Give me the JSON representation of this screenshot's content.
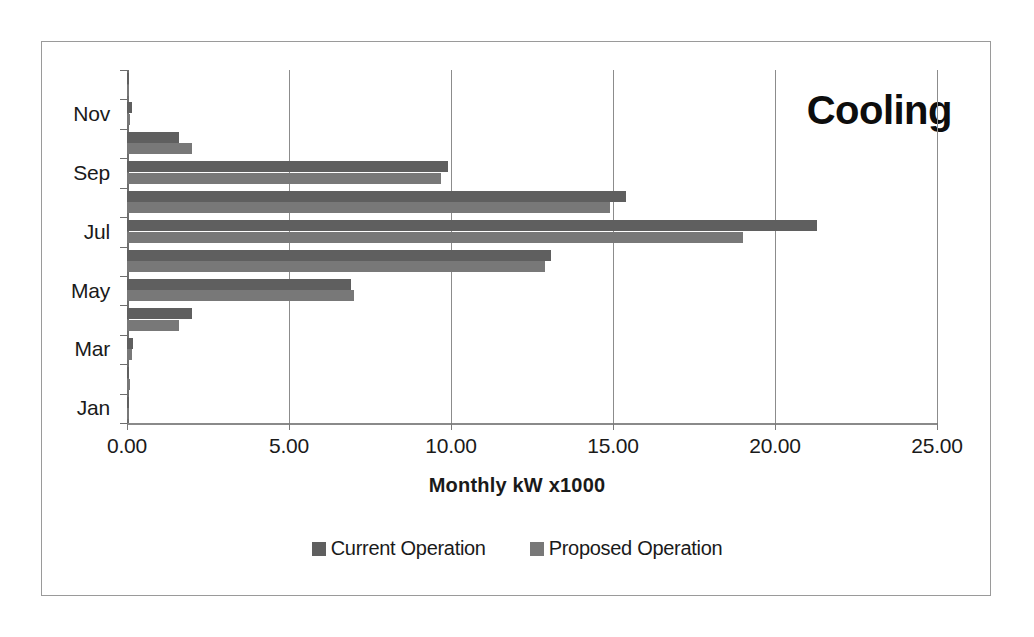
{
  "chart_data": {
    "type": "bar",
    "orientation": "horizontal",
    "title": "Cooling",
    "xlabel": "Monthly kW x1000",
    "ylabel": "",
    "xlim": [
      0,
      25
    ],
    "xticks": [
      "0.00",
      "5.00",
      "10.00",
      "15.00",
      "20.00",
      "25.00"
    ],
    "xtick_values": [
      0,
      5,
      10,
      15,
      20,
      25
    ],
    "grid": true,
    "legend_position": "bottom",
    "categories": [
      "Jan",
      "Feb",
      "Mar",
      "Apr",
      "May",
      "Jun",
      "Jul",
      "Aug",
      "Sep",
      "Oct",
      "Nov",
      "Dec"
    ],
    "visible_category_labels": [
      "Jan",
      "Mar",
      "May",
      "Jul",
      "Sep",
      "Nov"
    ],
    "series": [
      {
        "name": "Current Operation",
        "color": "#5f5f5f",
        "values": [
          0.05,
          0.05,
          0.2,
          2.0,
          6.9,
          13.1,
          21.3,
          15.4,
          9.9,
          1.6,
          0.15,
          0.05
        ]
      },
      {
        "name": "Proposed Operation",
        "color": "#787878",
        "values": [
          0.05,
          0.08,
          0.15,
          1.6,
          7.0,
          12.9,
          19.0,
          14.9,
          9.7,
          2.0,
          0.1,
          0.05
        ]
      }
    ]
  },
  "legend": {
    "items": [
      {
        "label": "Current Operation",
        "swatch": "current"
      },
      {
        "label": "Proposed Operation",
        "swatch": "proposed"
      }
    ]
  }
}
